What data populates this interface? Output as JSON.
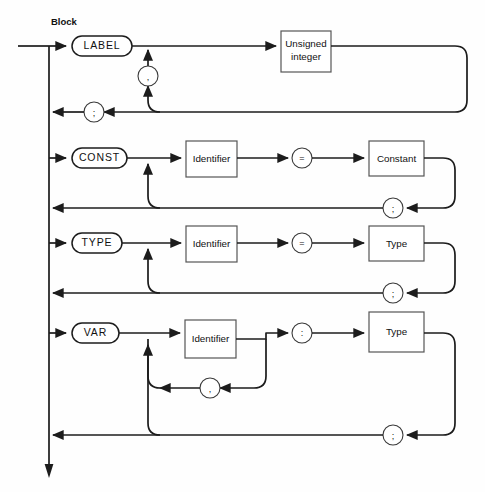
{
  "diagram": {
    "title": "Block",
    "kind": "syntax-railroad-diagram",
    "canvas": {
      "width": 485,
      "height": 492
    },
    "colors": {
      "background": "#ffffff",
      "line": "#1c1c1c",
      "box_stroke": "#555555",
      "text": "#111111"
    },
    "sections": [
      {
        "id": "label-section",
        "keyword": "LABEL",
        "items": [
          "Unsigned integer"
        ],
        "repeat_separator": ",",
        "terminator": ";"
      },
      {
        "id": "const-section",
        "keyword": "CONST",
        "items": [
          "Identifier",
          "=",
          "Constant"
        ],
        "repeat_separator": "",
        "terminator": ";"
      },
      {
        "id": "type-section",
        "keyword": "TYPE",
        "items": [
          "Identifier",
          "=",
          "Type"
        ],
        "repeat_separator": "",
        "terminator": ";"
      },
      {
        "id": "var-section",
        "keyword": "VAR",
        "items": [
          "Identifier",
          ":",
          "Type"
        ],
        "repeat_separator": ",",
        "terminator": ";"
      }
    ]
  },
  "nodes": {
    "title_label": "Block",
    "keyword_label": "LABEL",
    "keyword_const": "CONST",
    "keyword_type": "TYPE",
    "keyword_var": "VAR",
    "box_unsigned_integer_line1": "Unsigned",
    "box_unsigned_integer_line2": "integer",
    "box_identifier_const": "Identifier",
    "box_identifier_type": "Identifier",
    "box_identifier_var": "Identifier",
    "box_constant": "Constant",
    "box_type_type": "Type",
    "box_type_var": "Type",
    "circle_comma_label": ",",
    "circle_semicolon_label": ";",
    "circle_equals_const": "=",
    "circle_semicolon_const": ";",
    "circle_equals_type": "=",
    "circle_semicolon_type": ";",
    "circle_colon_var": ":",
    "circle_comma_var": ",",
    "circle_semicolon_var": ";"
  }
}
